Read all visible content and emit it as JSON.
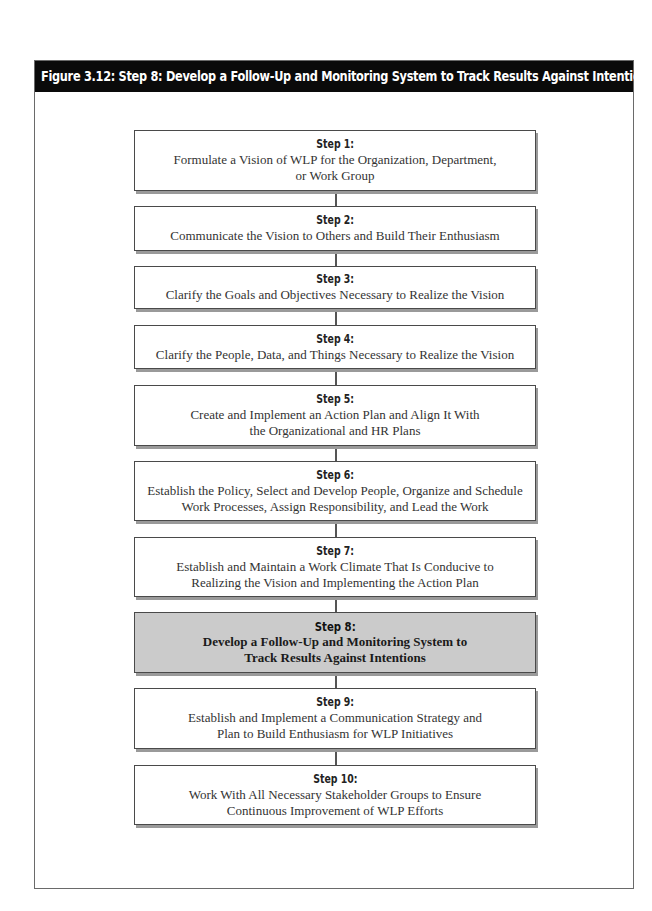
{
  "figure": {
    "title": "Figure 3.12: Step 8: Develop a Follow-Up and Monitoring System to Track Results Against Intentions",
    "header_bg": "#0a0a0a",
    "header_text_color": "#ffffff",
    "highlight_fill": "#cbcbcb"
  },
  "steps": [
    {
      "label": "Step 1:",
      "lines": [
        "Formulate a Vision of WLP for the Organization, Department,",
        "or Work Group"
      ],
      "highlighted": false
    },
    {
      "label": "Step 2:",
      "lines": [
        "Communicate the Vision to Others and Build Their Enthusiasm"
      ],
      "highlighted": false
    },
    {
      "label": "Step 3:",
      "lines": [
        "Clarify the Goals and Objectives Necessary to Realize the Vision"
      ],
      "highlighted": false
    },
    {
      "label": "Step 4:",
      "lines": [
        "Clarify the People, Data, and Things Necessary to Realize the Vision"
      ],
      "highlighted": false
    },
    {
      "label": "Step 5:",
      "lines": [
        "Create and Implement an Action Plan and Align It With",
        "the Organizational and HR Plans"
      ],
      "highlighted": false
    },
    {
      "label": "Step 6:",
      "lines": [
        "Establish the Policy, Select and Develop People, Organize and Schedule",
        "Work Processes, Assign Responsibility, and Lead the Work"
      ],
      "highlighted": false
    },
    {
      "label": "Step 7:",
      "lines": [
        "Establish and Maintain a Work Climate That Is Conducive to",
        "Realizing the Vision and Implementing the Action Plan"
      ],
      "highlighted": false
    },
    {
      "label": "Step 8:",
      "lines": [
        "Develop a Follow-Up and Monitoring System to",
        "Track Results Against Intentions"
      ],
      "highlighted": true
    },
    {
      "label": "Step 9:",
      "lines": [
        "Establish and Implement a Communication Strategy and",
        "Plan to Build Enthusiasm for WLP Initiatives"
      ],
      "highlighted": false
    },
    {
      "label": "Step 10:",
      "lines": [
        "Work With All Necessary Stakeholder Groups to Ensure",
        "Continuous Improvement of WLP Efforts"
      ],
      "highlighted": false
    }
  ]
}
